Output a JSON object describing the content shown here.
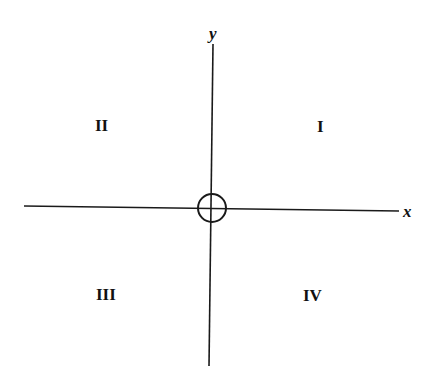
{
  "diagram": {
    "type": "coordinate-plane-quadrants",
    "axes": {
      "x": {
        "label": "x"
      },
      "y": {
        "label": "y"
      }
    },
    "origin": {
      "marker": "circle-with-crosshair"
    },
    "quadrants": [
      {
        "id": "I",
        "label": "I",
        "position": "upper-right"
      },
      {
        "id": "II",
        "label": "II",
        "position": "upper-left"
      },
      {
        "id": "III",
        "label": "III",
        "position": "lower-left"
      },
      {
        "id": "IV",
        "label": "IV",
        "position": "lower-right"
      }
    ],
    "colors": {
      "stroke": "#1a1a1a",
      "background": "#ffffff"
    }
  }
}
